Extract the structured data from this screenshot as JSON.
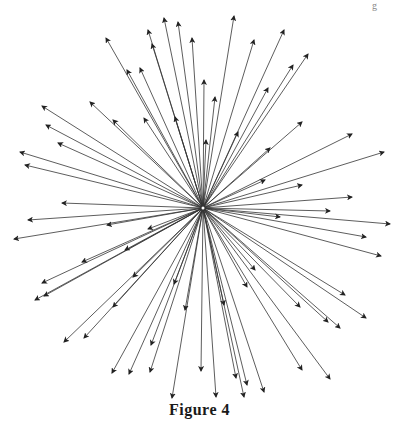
{
  "figure": {
    "caption": "Figure 4",
    "corner_text": "g",
    "center": [
      203,
      208
    ],
    "line_color": "#333333",
    "arrows": [
      {
        "tip": [
          106,
          38
        ]
      },
      {
        "tip": [
          127,
          70
        ]
      },
      {
        "tip": [
          140,
          68
        ]
      },
      {
        "tip": [
          148,
          30
        ]
      },
      {
        "tip": [
          152,
          44
        ]
      },
      {
        "tip": [
          164,
          18
        ]
      },
      {
        "tip": [
          178,
          22
        ]
      },
      {
        "tip": [
          192,
          38
        ]
      },
      {
        "tip": [
          204,
          80
        ]
      },
      {
        "tip": [
          206,
          140
        ]
      },
      {
        "tip": [
          234,
          16
        ]
      },
      {
        "tip": [
          254,
          40
        ]
      },
      {
        "tip": [
          284,
          30
        ]
      },
      {
        "tip": [
          268,
          88
        ]
      },
      {
        "tip": [
          293,
          65
        ]
      },
      {
        "tip": [
          308,
          54
        ]
      },
      {
        "tip": [
          302,
          122
        ]
      },
      {
        "tip": [
          352,
          134
        ]
      },
      {
        "tip": [
          384,
          152
        ]
      },
      {
        "tip": [
          302,
          185
        ]
      },
      {
        "tip": [
          352,
          197
        ]
      },
      {
        "tip": [
          390,
          224
        ]
      },
      {
        "tip": [
          366,
          237
        ]
      },
      {
        "tip": [
          381,
          256
        ]
      },
      {
        "tip": [
          345,
          295
        ]
      },
      {
        "tip": [
          366,
          318
        ]
      },
      {
        "tip": [
          328,
          322
        ]
      },
      {
        "tip": [
          340,
          328
        ]
      },
      {
        "tip": [
          300,
          307
        ]
      },
      {
        "tip": [
          330,
          379
        ]
      },
      {
        "tip": [
          302,
          370
        ]
      },
      {
        "tip": [
          264,
          392
        ]
      },
      {
        "tip": [
          247,
          385
        ]
      },
      {
        "tip": [
          244,
          397
        ]
      },
      {
        "tip": [
          236,
          378
        ]
      },
      {
        "tip": [
          216,
          397
        ]
      },
      {
        "tip": [
          201,
          371
        ]
      },
      {
        "tip": [
          172,
          398
        ]
      },
      {
        "tip": [
          150,
          372
        ]
      },
      {
        "tip": [
          151,
          345
        ]
      },
      {
        "tip": [
          129,
          374
        ]
      },
      {
        "tip": [
          112,
          373
        ]
      },
      {
        "tip": [
          84,
          338
        ]
      },
      {
        "tip": [
          64,
          342
        ]
      },
      {
        "tip": [
          113,
          307
        ]
      },
      {
        "tip": [
          35,
          300
        ]
      },
      {
        "tip": [
          44,
          296
        ]
      },
      {
        "tip": [
          42,
          283
        ]
      },
      {
        "tip": [
          82,
          262
        ]
      },
      {
        "tip": [
          14,
          239
        ]
      },
      {
        "tip": [
          28,
          220
        ]
      },
      {
        "tip": [
          62,
          203
        ]
      },
      {
        "tip": [
          25,
          165
        ]
      },
      {
        "tip": [
          20,
          152
        ]
      },
      {
        "tip": [
          58,
          143
        ]
      },
      {
        "tip": [
          46,
          125
        ]
      },
      {
        "tip": [
          42,
          106
        ]
      },
      {
        "tip": [
          90,
          102
        ]
      },
      {
        "tip": [
          113,
          120
        ]
      },
      {
        "tip": [
          144,
          118
        ]
      },
      {
        "tip": [
          175,
          117
        ]
      },
      {
        "tip": [
          215,
          97
        ]
      },
      {
        "tip": [
          238,
          132
        ]
      },
      {
        "tip": [
          270,
          148
        ]
      },
      {
        "tip": [
          265,
          180
        ]
      },
      {
        "tip": [
          280,
          217
        ]
      },
      {
        "tip": [
          330,
          211
        ]
      },
      {
        "tip": [
          255,
          270
        ]
      },
      {
        "tip": [
          247,
          287
        ]
      },
      {
        "tip": [
          224,
          305
        ]
      },
      {
        "tip": [
          185,
          310
        ]
      },
      {
        "tip": [
          174,
          284
        ]
      },
      {
        "tip": [
          133,
          277
        ]
      },
      {
        "tip": [
          125,
          250
        ]
      },
      {
        "tip": [
          148,
          229
        ]
      },
      {
        "tip": [
          107,
          225
        ]
      }
    ]
  }
}
